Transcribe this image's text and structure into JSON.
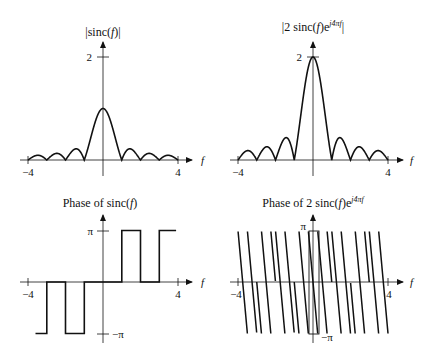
{
  "panels": {
    "mag_sinc": {
      "title_pre": "|sinc(",
      "title_var": "f",
      "title_post": ")|",
      "ytick": "2",
      "xmin": "−4",
      "xmax": "4",
      "xvar": "f"
    },
    "mag_shift": {
      "title_pre": "|2 sinc(",
      "title_var": "f",
      "title_mid": ")e",
      "title_sup": "j4πf",
      "title_post": "|",
      "ytick": "2",
      "xmin": "−4",
      "xmax": "4",
      "xvar": "f"
    },
    "phase_sinc": {
      "title_pre": "Phase of sinc(",
      "title_var": "f",
      "title_post": ")",
      "ytick_top": "π",
      "ytick_bot": "−π",
      "xmin": "−4",
      "xmax": "4",
      "xvar": "f"
    },
    "phase_shift": {
      "title_pre": "Phase of 2 sinc(",
      "title_var": "f",
      "title_mid": ")e",
      "title_sup": "j4πf",
      "ytick_top": "π",
      "ytick_bot": "−π",
      "xmin": "−4",
      "xmax": "4",
      "xvar": "f"
    }
  },
  "chart_data": [
    {
      "type": "line",
      "title": "|sinc(f)|",
      "xlabel": "f",
      "ylabel": "",
      "xlim": [
        -4,
        4
      ],
      "ylim": [
        0,
        2
      ],
      "xticks": [
        -4,
        4
      ],
      "yticks": [
        2
      ],
      "function": "abs(sinc(f))",
      "peak": 1,
      "zeros": [
        -3,
        -2,
        -1,
        1,
        2,
        3
      ]
    },
    {
      "type": "line",
      "title": "|2 sinc(f)e^{j4πf}|",
      "xlabel": "f",
      "ylabel": "",
      "xlim": [
        -4,
        4
      ],
      "ylim": [
        0,
        2
      ],
      "xticks": [
        -4,
        4
      ],
      "yticks": [
        2
      ],
      "function": "abs(2*sinc(f))",
      "peak": 2,
      "zeros": [
        -3,
        -2,
        -1,
        1,
        2,
        3
      ]
    },
    {
      "type": "line",
      "title": "Phase of sinc(f)",
      "xlabel": "f",
      "ylabel": "",
      "xlim": [
        -4,
        4
      ],
      "ylim": [
        -3.1416,
        3.1416
      ],
      "xticks": [
        -4,
        4
      ],
      "yticks": [
        "π",
        "−π"
      ],
      "segments": [
        {
          "f": [
            -3.6,
            -3
          ],
          "phase": "−π"
        },
        {
          "f": [
            -3,
            -2
          ],
          "phase": "0"
        },
        {
          "f": [
            -2,
            -1
          ],
          "phase": "−π"
        },
        {
          "f": [
            -1,
            1
          ],
          "phase": "0"
        },
        {
          "f": [
            1,
            2
          ],
          "phase": "π"
        },
        {
          "f": [
            2,
            3
          ],
          "phase": "0"
        },
        {
          "f": [
            3,
            3.9
          ],
          "phase": "π"
        }
      ]
    },
    {
      "type": "line",
      "title": "Phase of 2 sinc(f)e^{j4πf}",
      "xlabel": "f",
      "ylabel": "",
      "xlim": [
        -4,
        4
      ],
      "ylim": [
        -3.1416,
        3.1416
      ],
      "xticks": [
        -4,
        4
      ],
      "yticks": [
        "π",
        "−π"
      ],
      "function": "wrap(phase(sinc(f)) - 4πf)",
      "f_range": [
        -4,
        4
      ],
      "note": "sawtooth wrapping, 2 cycles per unit f, highlighted box around f≈0"
    }
  ]
}
